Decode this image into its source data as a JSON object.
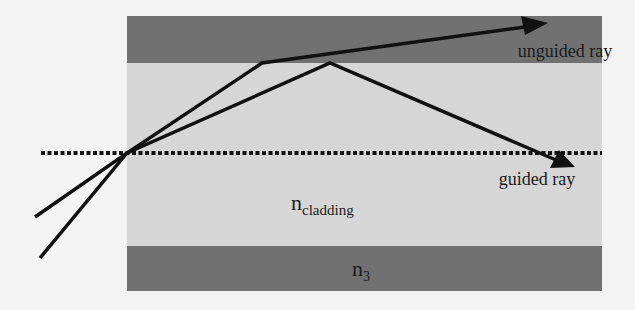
{
  "diagram": {
    "colors": {
      "background": "#f3f3f3",
      "cladding_band": "#717171",
      "core": "#d6d6d6",
      "ray": "#111111",
      "axis": "#111111"
    },
    "layers": {
      "top_band": {
        "label": ""
      },
      "core": {
        "label_main": "n",
        "label_sub": "cladding"
      },
      "bottom_band": {
        "label_main": "n",
        "label_sub": "3"
      }
    },
    "rays": {
      "unguided": {
        "label": "unguided ray"
      },
      "guided": {
        "label": "guided ray"
      }
    },
    "axis": {
      "style": "dotted"
    }
  }
}
